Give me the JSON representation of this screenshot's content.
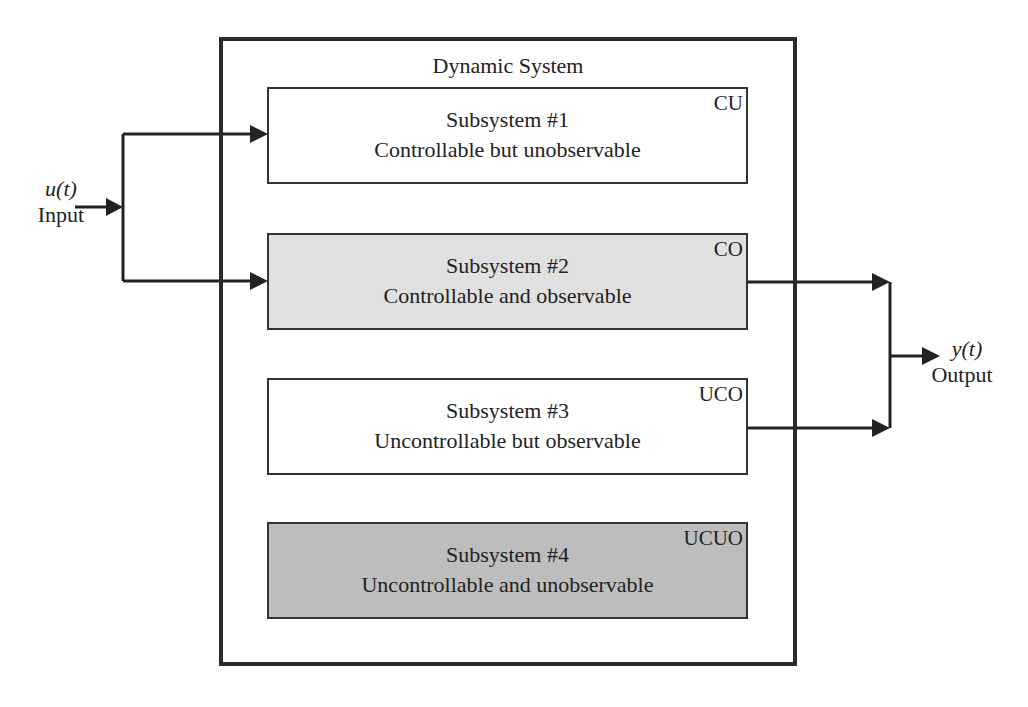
{
  "diagram": {
    "title": "Dynamic System",
    "input": {
      "symbol": "u(t)",
      "label": "Input"
    },
    "output": {
      "symbol": "y(t)",
      "label": "Output"
    },
    "subsystems": [
      {
        "name": "Subsystem #1",
        "description": "Controllable but unobservable",
        "tag": "CU",
        "fill": "#ffffff"
      },
      {
        "name": "Subsystem #2",
        "description": "Controllable and observable",
        "tag": "CO",
        "fill": "#e0e0e0"
      },
      {
        "name": "Subsystem #3",
        "description": "Uncontrollable but observable",
        "tag": "UCO",
        "fill": "#ffffff"
      },
      {
        "name": "Subsystem #4",
        "description": "Uncontrollable and unobservable",
        "tag": "UCUO",
        "fill": "#bdbdbd"
      }
    ],
    "connections": [
      {
        "from": "Input",
        "to": "Subsystem #1"
      },
      {
        "from": "Input",
        "to": "Subsystem #2"
      },
      {
        "from": "Subsystem #2",
        "to": "Output"
      },
      {
        "from": "Subsystem #3",
        "to": "Output"
      }
    ]
  }
}
